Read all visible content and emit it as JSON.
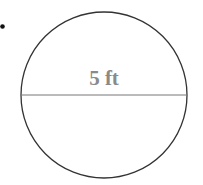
{
  "diagram": {
    "shape": "circle",
    "diameter_label": "5 ft",
    "colors": {
      "stroke": "#333333",
      "label": "#8a8a8a",
      "bullet": "#111111"
    }
  }
}
